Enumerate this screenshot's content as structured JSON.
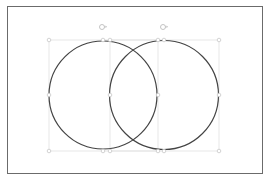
{
  "slide": {
    "background": "#ffffff",
    "border_color": "#6b6b6b"
  },
  "shapes": [
    {
      "type": "circle",
      "name": "left-circle",
      "stroke": "#444444",
      "selected": true
    },
    {
      "type": "circle",
      "name": "right-circle",
      "stroke": "#444444",
      "selected": true
    }
  ],
  "selection": {
    "handle_color": "#d0d0d0",
    "rotate_icon": "rotate-handle-icon"
  }
}
